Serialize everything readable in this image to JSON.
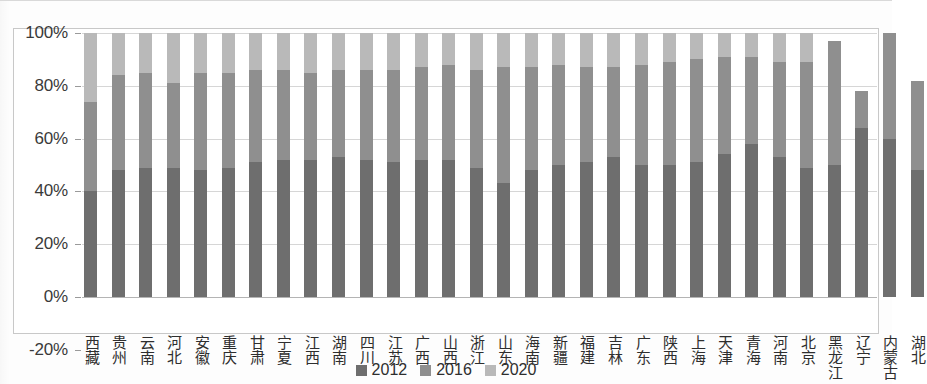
{
  "chart_data": {
    "type": "bar",
    "subtype": "stacked-100-percent",
    "title": "",
    "xlabel": "",
    "ylabel": "",
    "ylim": [
      -20,
      100
    ],
    "ytick_labels": [
      "100%",
      "80%",
      "60%",
      "40%",
      "20%",
      "0%",
      "-20%"
    ],
    "ytick_values": [
      100,
      80,
      60,
      40,
      20,
      0,
      -20
    ],
    "grid": true,
    "legend_position": "bottom-center",
    "categories": [
      "西藏",
      "贵州",
      "云南",
      "河北",
      "安徽",
      "重庆",
      "甘肃",
      "宁夏",
      "江西",
      "湖南",
      "四川",
      "江苏",
      "广西",
      "山西",
      "浙江",
      "山东",
      "海南",
      "新疆",
      "福建",
      "吉林",
      "广东",
      "陕西",
      "上海",
      "天津",
      "青海",
      "河南",
      "北京",
      "黑龙江",
      "辽宁",
      "内蒙古",
      "湖北"
    ],
    "series": [
      {
        "name": "2012",
        "color": "#6e6e6e",
        "values": [
          40,
          48,
          49,
          49,
          48,
          49,
          51,
          52,
          52,
          53,
          52,
          51,
          52,
          52,
          49,
          43,
          48,
          50,
          51,
          53,
          50,
          50,
          51,
          54,
          58,
          53,
          49,
          50,
          64,
          60,
          48
        ]
      },
      {
        "name": "2016",
        "color": "#8f8f8f",
        "values": [
          34,
          36,
          36,
          32,
          37,
          36,
          35,
          34,
          33,
          33,
          34,
          35,
          35,
          36,
          37,
          44,
          39,
          38,
          36,
          34,
          38,
          39,
          39,
          37,
          33,
          36,
          40,
          47,
          14,
          40,
          34
        ]
      },
      {
        "name": "2020",
        "color": "#b9b9b9",
        "values": [
          26,
          16,
          15,
          19,
          15,
          15,
          14,
          14,
          15,
          14,
          14,
          14,
          13,
          12,
          14,
          13,
          13,
          12,
          13,
          13,
          12,
          11,
          10,
          9,
          9,
          11,
          11,
          0,
          0,
          0,
          0
        ]
      }
    ],
    "bar_totals": [
      100,
      100,
      100,
      100,
      100,
      100,
      100,
      100,
      100,
      100,
      100,
      100,
      100,
      100,
      100,
      100,
      100,
      100,
      100,
      100,
      100,
      100,
      100,
      100,
      100,
      100,
      100,
      97,
      78,
      100,
      82
    ]
  },
  "legend": {
    "items": [
      {
        "label": "2012",
        "color": "#6e6e6e"
      },
      {
        "label": "2016",
        "color": "#8f8f8f"
      },
      {
        "label": "2020",
        "color": "#b9b9b9"
      }
    ]
  }
}
